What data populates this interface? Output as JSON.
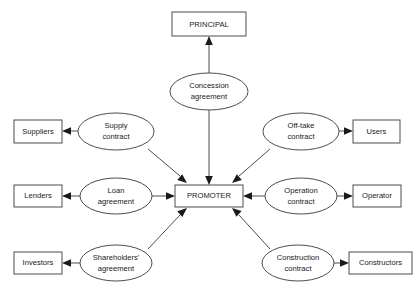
{
  "diagram": {
    "background_color": "#ffffff",
    "line_color": "#4d4d4d",
    "text_color": "#1a1a1a",
    "center": {
      "label": "PROMOTER",
      "shape": "rect"
    },
    "nodes": [
      {
        "id": "principal",
        "label": "PRINCIPAL",
        "shape": "rect"
      },
      {
        "id": "suppliers",
        "label": "Suppliers",
        "shape": "rect"
      },
      {
        "id": "lenders",
        "label": "Lenders",
        "shape": "rect"
      },
      {
        "id": "investors",
        "label": "Investors",
        "shape": "rect"
      },
      {
        "id": "users",
        "label": "Users",
        "shape": "rect"
      },
      {
        "id": "operator",
        "label": "Operator",
        "shape": "rect"
      },
      {
        "id": "constructors",
        "label": "Constructors",
        "shape": "rect"
      }
    ],
    "contracts": [
      {
        "id": "concession",
        "shape": "ellipse",
        "line1": "Concession",
        "line2": "agreement"
      },
      {
        "id": "supply",
        "shape": "ellipse",
        "line1": "Supply",
        "line2": "contract"
      },
      {
        "id": "loan",
        "shape": "ellipse",
        "line1": "Loan",
        "line2": "agreement"
      },
      {
        "id": "shareholders",
        "shape": "ellipse",
        "line1": "Shareholders'",
        "line2": "agreement"
      },
      {
        "id": "offtake",
        "shape": "ellipse",
        "line1": "Off-take",
        "line2": "contract"
      },
      {
        "id": "operation",
        "shape": "ellipse",
        "line1": "Operation",
        "line2": "contract"
      },
      {
        "id": "construction",
        "shape": "ellipse",
        "line1": "Construction",
        "line2": "contract"
      }
    ],
    "edges": [
      {
        "id": "edge-concession-principal",
        "from": "concession",
        "to": "principal",
        "arrow": "to"
      },
      {
        "id": "edge-concession-promoter",
        "from": "concession",
        "to": "promoter",
        "arrow": "to"
      },
      {
        "id": "edge-supply-suppliers",
        "from": "supply",
        "to": "suppliers",
        "arrow": "to"
      },
      {
        "id": "edge-supply-promoter",
        "from": "supply",
        "to": "promoter",
        "arrow": "to"
      },
      {
        "id": "edge-loan-lenders",
        "from": "loan",
        "to": "lenders",
        "arrow": "to"
      },
      {
        "id": "edge-loan-promoter",
        "from": "loan",
        "to": "promoter",
        "arrow": "to"
      },
      {
        "id": "edge-shareholders-investors",
        "from": "shareholders",
        "to": "investors",
        "arrow": "to"
      },
      {
        "id": "edge-shareholders-promoter",
        "from": "shareholders",
        "to": "promoter",
        "arrow": "to"
      },
      {
        "id": "edge-offtake-users",
        "from": "offtake",
        "to": "users",
        "arrow": "to"
      },
      {
        "id": "edge-offtake-promoter",
        "from": "offtake",
        "to": "promoter",
        "arrow": "to"
      },
      {
        "id": "edge-operation-operator",
        "from": "operation",
        "to": "operator",
        "arrow": "to"
      },
      {
        "id": "edge-operation-promoter",
        "from": "operation",
        "to": "promoter",
        "arrow": "to"
      },
      {
        "id": "edge-construction-constructors",
        "from": "construction",
        "to": "constructors",
        "arrow": "to"
      },
      {
        "id": "edge-construction-promoter",
        "from": "construction",
        "to": "promoter",
        "arrow": "to"
      }
    ]
  }
}
